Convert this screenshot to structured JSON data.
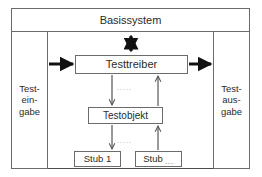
{
  "diagram": {
    "type": "block-diagram",
    "frame": {
      "name": "Testumgebung-Rahmen"
    },
    "nodes": [
      {
        "id": "basissystem",
        "label": "Basissystem"
      },
      {
        "id": "testeingabe",
        "label_lines": [
          "Test-",
          "ein-",
          "gabe"
        ]
      },
      {
        "id": "testausgabe",
        "label_lines": [
          "Test-",
          "aus-",
          "gabe"
        ]
      },
      {
        "id": "testtreiber",
        "label": "Testtreiber"
      },
      {
        "id": "testobjekt",
        "label": "Testobjekt"
      },
      {
        "id": "stub1",
        "label": "Stub 1"
      },
      {
        "id": "stubn",
        "label": "Stub",
        "suffix": "..."
      }
    ],
    "edge_labels": {
      "treiber_objekt": ".....",
      "objekt_stub": "....."
    },
    "colors": {
      "line": "#4d4d4d",
      "box_border": "#6b6b6b",
      "arrow": "#111111",
      "thin_arrow": "#555555",
      "text": "#2b2b2b",
      "muted": "#9a9a9a",
      "background": "#ffffff"
    }
  }
}
